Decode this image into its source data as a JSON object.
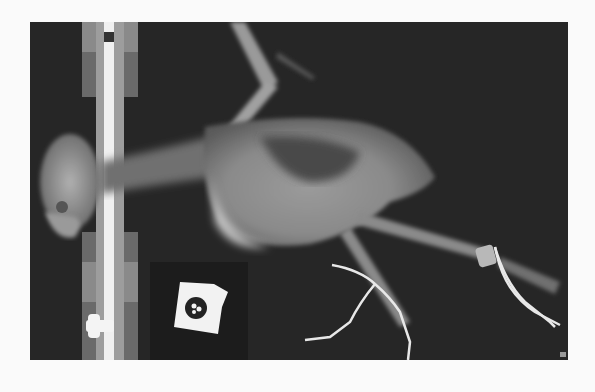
{
  "image": {
    "type": "radiograph",
    "subject": "bird lateral x-ray",
    "background_color": "#fafafa",
    "film_color": "#262626",
    "marker_symbol": "R"
  }
}
